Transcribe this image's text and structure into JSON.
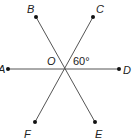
{
  "diagram": {
    "type": "intersecting-lines",
    "center": {
      "label": "O"
    },
    "points": [
      {
        "label": "A"
      },
      {
        "label": "B"
      },
      {
        "label": "C"
      },
      {
        "label": "D"
      },
      {
        "label": "E"
      },
      {
        "label": "F"
      }
    ],
    "lines": [
      "AD",
      "BE",
      "CF"
    ],
    "angle_annotation": {
      "angle": "COD",
      "value": "60°"
    },
    "line_color": "#555555",
    "point_color": "#111111"
  }
}
